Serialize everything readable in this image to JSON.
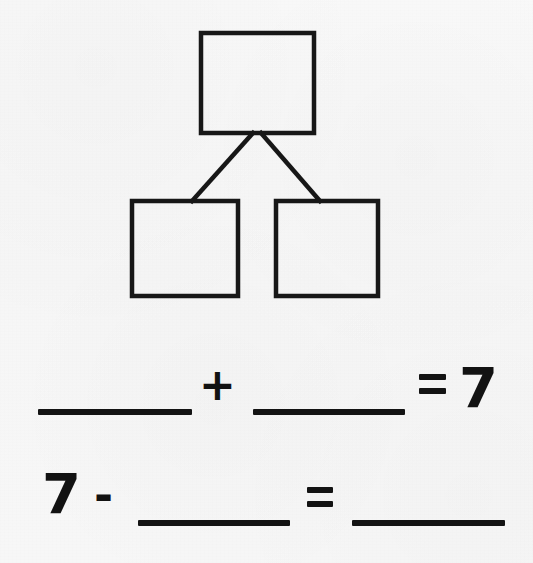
{
  "worksheet": {
    "title": "Number bond and fact family worksheet",
    "background_color": "#f7f7f7",
    "ink_color": "#131313",
    "whole": "7"
  },
  "number_bond": {
    "label": "number-bond-diagram",
    "stroke_color": "#171717",
    "stroke_width": 4,
    "boxes": [
      {
        "name": "whole-box",
        "role": "whole",
        "value": "",
        "x": 201,
        "y": 33,
        "width": 113,
        "height": 100
      },
      {
        "name": "part-box-left",
        "role": "part",
        "value": "",
        "x": 132,
        "y": 201,
        "width": 106,
        "height": 95
      },
      {
        "name": "part-box-right",
        "role": "part",
        "value": "",
        "x": 276,
        "y": 201,
        "width": 102,
        "height": 95
      }
    ],
    "connectors": [
      {
        "name": "connector-left",
        "x1": 253,
        "y1": 133,
        "x2": 192,
        "y2": 201
      },
      {
        "name": "connector-right",
        "x1": 261,
        "y1": 133,
        "x2": 320,
        "y2": 201
      }
    ]
  },
  "equations": [
    {
      "name": "addition-equation",
      "expression": "___ + ___ = 7",
      "tokens": [
        {
          "kind": "blank",
          "name": "addend-blank-1",
          "x": 38,
          "y": 409,
          "width": 154,
          "height": 6
        },
        {
          "kind": "operator",
          "name": "plus-operator",
          "text": "+",
          "x": 199,
          "y": 363
        },
        {
          "kind": "blank",
          "name": "addend-blank-2",
          "x": 253,
          "y": 409,
          "width": 152,
          "height": 6
        },
        {
          "kind": "equals",
          "name": "equals-sign-1",
          "x": 419,
          "y": 374,
          "width": 27
        },
        {
          "kind": "numeral",
          "name": "sum-value",
          "text": "7",
          "x": 459,
          "y": 360
        }
      ]
    },
    {
      "name": "subtraction-equation",
      "expression": "7 - ___ = ___",
      "tokens": [
        {
          "kind": "numeral",
          "name": "minuend-value",
          "text": "7",
          "x": 42,
          "y": 466
        },
        {
          "kind": "operator",
          "name": "minus-operator",
          "text": "-",
          "x": 94,
          "y": 472
        },
        {
          "kind": "blank",
          "name": "subtrahend-blank",
          "x": 138,
          "y": 520,
          "width": 152,
          "height": 6
        },
        {
          "kind": "equals",
          "name": "equals-sign-2",
          "x": 307,
          "y": 487,
          "width": 26
        },
        {
          "kind": "blank",
          "name": "difference-blank",
          "x": 352,
          "y": 520,
          "width": 153,
          "height": 6
        }
      ]
    }
  ]
}
